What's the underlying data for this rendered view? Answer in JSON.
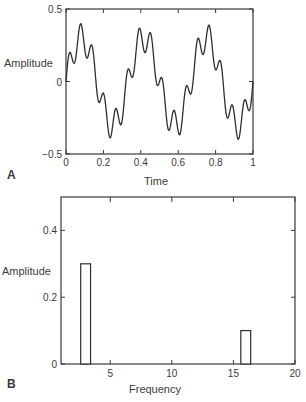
{
  "chart_data": [
    {
      "panel_label": "A",
      "type": "line",
      "title": "",
      "xlabel": "Time",
      "ylabel": "Amplitude",
      "xlim": [
        0,
        1
      ],
      "ylim": [
        -0.5,
        0.5
      ],
      "xticks": [
        0,
        0.2,
        0.4,
        0.6,
        0.8,
        1
      ],
      "xtick_labels": [
        "0",
        "0.2",
        "0.4",
        "0.6",
        "0.8",
        "1"
      ],
      "yticks": [
        -0.5,
        0,
        0.5
      ],
      "ytick_labels": [
        "−0.5",
        "0",
        "0.5"
      ],
      "grid": false,
      "series": [
        {
          "name": "signal",
          "formula": "0.3*sin(2*pi*3*t) + 0.1*sin(2*pi*16*t)",
          "components": [
            {
              "amplitude": 0.3,
              "frequency": 3
            },
            {
              "amplitude": 0.1,
              "frequency": 16
            }
          ]
        }
      ]
    },
    {
      "panel_label": "B",
      "type": "bar",
      "title": "",
      "xlabel": "Frequency",
      "ylabel": "Amplitude",
      "xlim": [
        1,
        20
      ],
      "ylim": [
        0,
        0.5
      ],
      "xticks": [
        5,
        10,
        15,
        20
      ],
      "xtick_labels": [
        "5",
        "10",
        "15",
        "20"
      ],
      "yticks": [
        0,
        0.2,
        0.4
      ],
      "ytick_labels": [
        "0",
        "0.2",
        "0.4"
      ],
      "grid": false,
      "categories": [
        3,
        16
      ],
      "values": [
        0.3,
        0.1
      ],
      "bar_width": 0.8
    }
  ]
}
